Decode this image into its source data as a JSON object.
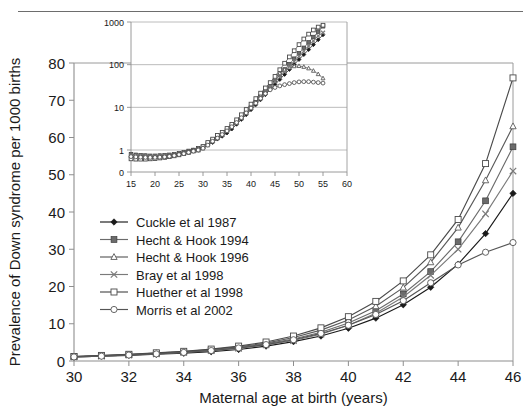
{
  "page": {
    "scan_artifact_text": "",
    "background_color": "#ffffff"
  },
  "chart_data": {
    "type": "line",
    "title": "",
    "xlabel": "Maternal age at birth (years)",
    "ylabel": "Prevalence of Down syndrome per 1000 births",
    "xlim": [
      30,
      46
    ],
    "ylim": [
      0,
      80
    ],
    "xticks": [
      30,
      32,
      34,
      36,
      38,
      40,
      42,
      44,
      46
    ],
    "yticks": [
      0,
      10,
      20,
      30,
      40,
      50,
      60,
      70,
      80
    ],
    "grid": false,
    "legend_position": "inside-left",
    "x": [
      30,
      31,
      32,
      33,
      34,
      35,
      36,
      37,
      38,
      39,
      40,
      41,
      42,
      43,
      44,
      45,
      46
    ],
    "series": [
      {
        "name": "Cuckle et al 1987",
        "marker": "filled-diamond",
        "color": "#1a1a1a",
        "values": [
          1.1,
          1.3,
          1.5,
          1.8,
          2.1,
          2.5,
          3.1,
          4.0,
          5.2,
          6.7,
          8.8,
          11.5,
          15.1,
          19.8,
          26.0,
          34.2,
          45.0
        ]
      },
      {
        "name": "Hecht & Hook 1994",
        "marker": "filled-square",
        "color": "#6b6b6b",
        "values": [
          1.2,
          1.4,
          1.7,
          2.0,
          2.4,
          2.9,
          3.6,
          4.6,
          5.9,
          7.7,
          10.2,
          13.5,
          18.0,
          24.0,
          32.0,
          43.0,
          57.5
        ]
      },
      {
        "name": "Hecht & Hook 1996",
        "marker": "open-triangle",
        "color": "#5a5a5a",
        "values": [
          1.2,
          1.4,
          1.7,
          2.1,
          2.5,
          3.1,
          3.8,
          4.8,
          6.3,
          8.3,
          11.0,
          14.7,
          19.7,
          26.5,
          35.8,
          48.5,
          63.0
        ]
      },
      {
        "name": "Bray et al 1998",
        "marker": "cross-x",
        "color": "#7a7a7a",
        "values": [
          1.1,
          1.3,
          1.6,
          1.9,
          2.3,
          2.8,
          3.4,
          4.3,
          5.5,
          7.2,
          9.6,
          12.8,
          17.2,
          23.0,
          30.0,
          39.5,
          51.0
        ]
      },
      {
        "name": "Huether et al 1998",
        "marker": "open-square",
        "color": "#4a4a4a",
        "values": [
          1.2,
          1.5,
          1.8,
          2.2,
          2.6,
          3.2,
          4.0,
          5.1,
          6.7,
          8.9,
          11.9,
          16.0,
          21.5,
          28.5,
          38.0,
          53.0,
          76.0
        ]
      },
      {
        "name": "Morris et al 2002",
        "marker": "open-circle",
        "color": "#555555",
        "values": [
          1.1,
          1.3,
          1.6,
          1.9,
          2.3,
          2.8,
          3.5,
          4.4,
          5.7,
          7.4,
          9.6,
          12.5,
          16.2,
          21.0,
          25.8,
          29.2,
          31.8
        ]
      }
    ],
    "inset": {
      "type": "line",
      "yscale": "log",
      "xlabel": "",
      "ylabel": "",
      "xlim": [
        15,
        60
      ],
      "xticks": [
        15,
        20,
        25,
        30,
        35,
        40,
        45,
        50,
        55,
        60
      ],
      "yticks": [
        0,
        1,
        10,
        100,
        1000
      ],
      "ytick_labels": [
        "0",
        "1",
        "10",
        "100",
        "1000"
      ],
      "grid": true,
      "x": [
        15,
        16,
        17,
        18,
        19,
        20,
        21,
        22,
        23,
        24,
        25,
        26,
        27,
        28,
        29,
        30,
        31,
        32,
        33,
        34,
        35,
        36,
        37,
        38,
        39,
        40,
        41,
        42,
        43,
        44,
        45,
        46,
        47,
        48,
        49,
        50,
        51,
        52,
        53,
        54,
        55
      ],
      "series": [
        {
          "name": "Cuckle et al 1987",
          "marker": "filled-diamond",
          "color": "#1a1a1a",
          "values": [
            0.72,
            0.7,
            0.69,
            0.68,
            0.68,
            0.68,
            0.69,
            0.7,
            0.72,
            0.75,
            0.78,
            0.82,
            0.88,
            0.95,
            1.0,
            1.1,
            1.3,
            1.5,
            1.8,
            2.1,
            2.5,
            3.1,
            4.0,
            5.2,
            6.7,
            8.8,
            11.5,
            15.1,
            19.8,
            26.0,
            34.2,
            45.0,
            59.0,
            77.0,
            101,
            132,
            172,
            225,
            294,
            384,
            500
          ]
        },
        {
          "name": "Hecht & Hook 1994",
          "marker": "filled-square",
          "color": "#6b6b6b",
          "values": [
            0.8,
            0.77,
            0.75,
            0.74,
            0.73,
            0.73,
            0.74,
            0.75,
            0.77,
            0.8,
            0.84,
            0.89,
            0.95,
            1.0,
            1.1,
            1.2,
            1.4,
            1.7,
            2.0,
            2.4,
            2.9,
            3.6,
            4.6,
            5.9,
            7.7,
            10.2,
            13.5,
            18.0,
            24.0,
            32.0,
            43.0,
            57.5,
            77.0,
            103,
            138,
            185,
            248,
            332,
            444,
            594,
            795
          ]
        },
        {
          "name": "Hecht & Hook 1996",
          "marker": "open-triangle",
          "color": "#5a5a5a",
          "values": [
            0.78,
            0.76,
            0.74,
            0.73,
            0.72,
            0.72,
            0.73,
            0.74,
            0.76,
            0.79,
            0.83,
            0.88,
            0.94,
            1.0,
            1.1,
            1.2,
            1.4,
            1.7,
            2.1,
            2.5,
            3.1,
            3.8,
            4.8,
            6.3,
            8.3,
            11.0,
            14.7,
            19.7,
            26.5,
            35.8,
            48.5,
            63.0,
            76.0,
            86.0,
            92.0,
            93.0,
            89.0,
            82.0,
            72.0,
            60.0,
            48.0
          ]
        },
        {
          "name": "Bray et al 1998",
          "marker": "cross-x",
          "color": "#7a7a7a",
          "values": [
            0.74,
            0.72,
            0.71,
            0.7,
            0.7,
            0.7,
            0.71,
            0.72,
            0.74,
            0.77,
            0.8,
            0.85,
            0.9,
            0.97,
            1.0,
            1.1,
            1.3,
            1.6,
            1.9,
            2.3,
            2.8,
            3.4,
            4.3,
            5.5,
            7.2,
            9.6,
            12.8,
            17.2,
            23.0,
            30.0,
            39.5,
            51.0,
            68.0,
            90.0,
            119,
            157,
            207,
            273,
            360,
            474,
            560
          ]
        },
        {
          "name": "Huether et al 1998",
          "marker": "open-square",
          "color": "#4a4a4a",
          "values": [
            0.62,
            0.61,
            0.61,
            0.61,
            0.62,
            0.63,
            0.65,
            0.67,
            0.7,
            0.73,
            0.77,
            0.82,
            0.88,
            0.95,
            1.0,
            1.2,
            1.5,
            1.8,
            2.2,
            2.6,
            3.2,
            4.0,
            5.1,
            6.7,
            8.9,
            11.9,
            16.0,
            21.5,
            28.5,
            38.0,
            53.0,
            76.0,
            108,
            152,
            212,
            295,
            400,
            520,
            650,
            760,
            840
          ]
        },
        {
          "name": "Morris et al 2002",
          "marker": "open-circle",
          "color": "#555555",
          "values": [
            0.7,
            0.69,
            0.68,
            0.67,
            0.67,
            0.67,
            0.68,
            0.69,
            0.71,
            0.74,
            0.78,
            0.82,
            0.88,
            0.94,
            1.0,
            1.1,
            1.3,
            1.6,
            1.9,
            2.3,
            2.8,
            3.5,
            4.4,
            5.7,
            7.4,
            9.6,
            12.5,
            16.2,
            21.0,
            25.8,
            29.2,
            31.8,
            34.0,
            36.0,
            38.0,
            39.5,
            40.0,
            40.0,
            39.0,
            38.0,
            37.0
          ]
        }
      ]
    }
  }
}
